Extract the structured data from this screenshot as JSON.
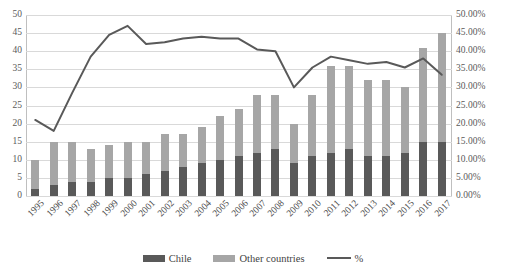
{
  "chart_data": {
    "type": "bar",
    "title": "",
    "subtitle": "",
    "xlabel": "",
    "ylabel": "",
    "y2label": "",
    "grid": true,
    "legend_position": "bottom",
    "stacked": true,
    "categories": [
      "1995",
      "1996",
      "1997",
      "1998",
      "1999",
      "2000",
      "2001",
      "2002",
      "2003",
      "2004",
      "2005",
      "2006",
      "2007",
      "2008",
      "2009",
      "2010",
      "2011",
      "2012",
      "2013",
      "2014",
      "2015",
      "2016",
      "2017"
    ],
    "ylim": [
      0,
      50
    ],
    "yticks": [
      "0",
      "5",
      "10",
      "15",
      "20",
      "25",
      "30",
      "35",
      "40",
      "45",
      "50"
    ],
    "y2lim": [
      0,
      0.5
    ],
    "y2ticks": [
      "0.00%",
      "5.00%",
      "10.00%",
      "15.00%",
      "20.00%",
      "25.00%",
      "30.00%",
      "35.00%",
      "40.00%",
      "45.00%",
      "50.00%"
    ],
    "series": [
      {
        "name": "Chile",
        "axis": "left",
        "type": "bar",
        "color": "#595959",
        "values": [
          2,
          3,
          4,
          4,
          5,
          5,
          6,
          7,
          8,
          9,
          10,
          11,
          12,
          13,
          9,
          11,
          12,
          13,
          11,
          11,
          12,
          15,
          15
        ]
      },
      {
        "name": "Other countries",
        "axis": "left",
        "type": "bar",
        "color": "#a6a6a6",
        "values": [
          8,
          12,
          11,
          9,
          9,
          10,
          9,
          10,
          9,
          10,
          12,
          13,
          16,
          15,
          11,
          17,
          24,
          23,
          21,
          21,
          18,
          26,
          30
        ]
      },
      {
        "name": "Total",
        "axis": "left",
        "type": "bar-total",
        "color": "",
        "values": [
          10,
          15,
          15,
          13,
          14,
          15,
          15,
          17,
          17,
          19,
          22,
          24,
          28,
          28,
          20,
          28,
          36,
          36,
          32,
          32,
          30,
          41,
          45
        ]
      },
      {
        "name": "%",
        "axis": "right",
        "type": "line",
        "color": "#595959",
        "values": [
          0.21,
          0.18,
          0.285,
          0.385,
          0.445,
          0.47,
          0.42,
          0.425,
          0.435,
          0.44,
          0.435,
          0.435,
          0.405,
          0.4,
          0.3,
          0.355,
          0.385,
          0.375,
          0.365,
          0.37,
          0.355,
          0.38,
          0.335
        ]
      }
    ],
    "legend": [
      {
        "label": "Chile",
        "marker": "square",
        "color": "#595959"
      },
      {
        "label": "Other countries",
        "marker": "square",
        "color": "#a6a6a6"
      },
      {
        "label": "%",
        "marker": "line",
        "color": "#595959"
      }
    ]
  }
}
